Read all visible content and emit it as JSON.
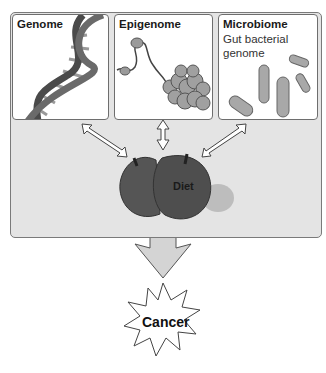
{
  "panels": [
    {
      "title": "Genome",
      "subtitle": ""
    },
    {
      "title": "Epigenome",
      "subtitle": ""
    },
    {
      "title": "Microbiome",
      "subtitle": "Gut bacterial genome"
    }
  ],
  "center": {
    "label": "Diet"
  },
  "outcome": {
    "label": "Cancer"
  },
  "colors": {
    "panel_bg": "#e4e4e4",
    "apple": "#5a5a5a",
    "arrow_fill": "#d4d4d4",
    "border": "#6e6e6e"
  }
}
